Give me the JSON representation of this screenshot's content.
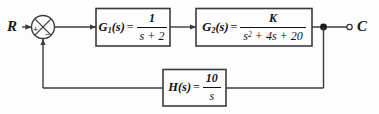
{
  "diagram": {
    "type": "control-block-diagram",
    "background_color": "#fdfdfd",
    "line_color": "#3b3b3b",
    "text_color": "#111111",
    "input": {
      "label": "R",
      "name": "reference-input"
    },
    "output": {
      "label": "C",
      "name": "controlled-output"
    },
    "summing_junction": {
      "name": "summing-junction",
      "style": "circle-with-x",
      "signs": {
        "input_sign": "+",
        "feedback_sign": "−"
      }
    },
    "blocks": [
      {
        "id": "g1",
        "name": "g1",
        "function": "G",
        "subscript": "1",
        "arg": "(s)",
        "equals": "=",
        "numerator": "1",
        "denominator": "s + 2",
        "denominator_exp": "",
        "plain": "G1(s) = 1/(s + 2)"
      },
      {
        "id": "g2",
        "name": "g2",
        "function": "G",
        "subscript": "2",
        "arg": "(s)",
        "equals": "=",
        "numerator": "K",
        "denominator_pre": "s",
        "denominator_exp": "2",
        "denominator_post": " + 4s + 20",
        "plain": "G2(s) = K/(s^2 + 4s + 20)"
      },
      {
        "id": "h",
        "name": "h",
        "function": "H",
        "subscript": "",
        "arg": "(s)",
        "equals": "=",
        "numerator": "10",
        "denominator": "s",
        "denominator_exp": "",
        "plain": "H(s) = 10/s"
      }
    ],
    "nodes": {
      "takeoff_point": "output-takeoff-node",
      "output_terminal": "output-terminal-circle"
    }
  }
}
